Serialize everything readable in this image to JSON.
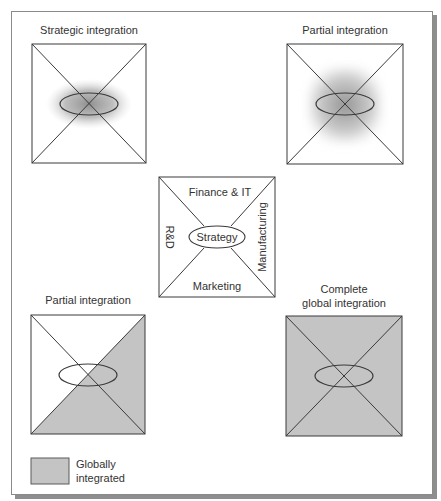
{
  "figure": {
    "panels": [
      {
        "id": "top-left",
        "title_lines": [
          "Strategic integration"
        ],
        "shading": "radial-ellipse-center"
      },
      {
        "id": "top-right",
        "title_lines": [
          "Partial integration"
        ],
        "shading": "radial-square-center"
      },
      {
        "id": "bottom-left",
        "title_lines": [
          "Partial integration"
        ],
        "shading": "right-and-bottom-triangles"
      },
      {
        "id": "bottom-right",
        "title_lines": [
          "Complete",
          "global integration"
        ],
        "shading": "full"
      }
    ],
    "center": {
      "core": "Strategy",
      "top": "Finance & IT",
      "right": "Manufacturing",
      "bottom": "Marketing",
      "left": "R&D"
    },
    "legend": {
      "label_lines": [
        "Globally",
        "integrated"
      ],
      "swatch_color": "#c4c4c4"
    },
    "colors": {
      "shade": "#c4c4c4",
      "line": "#3a3a3a",
      "gradient_dark": "#8a8a8a"
    }
  }
}
